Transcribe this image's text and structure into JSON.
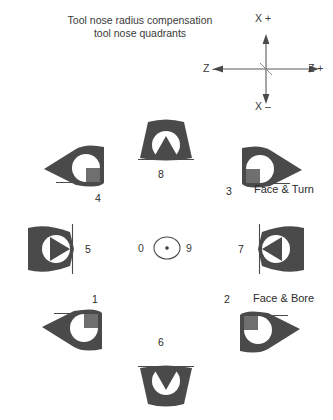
{
  "title": {
    "line1": "Tool nose radius compensation",
    "line2": "tool nose quadrants"
  },
  "axes": {
    "x_positive": "X +",
    "x_negative": "X –",
    "z_positive": "Z +",
    "z_negative": "Z –"
  },
  "center": {
    "left_number": "0",
    "right_number": "9"
  },
  "quadrants": [
    {
      "number": "8",
      "note": ""
    },
    {
      "number": "4",
      "note": ""
    },
    {
      "number": "3",
      "note": "Face & Turn"
    },
    {
      "number": "5",
      "note": ""
    },
    {
      "number": "7",
      "note": ""
    },
    {
      "number": "1",
      "note": ""
    },
    {
      "number": "2",
      "note": "Face & Bore"
    },
    {
      "number": "6",
      "note": ""
    }
  ],
  "colors": {
    "tool_body": "#4a4a4a",
    "tool_hole": "#ffffff",
    "tool_square": "#6f6f6f",
    "background": "#ffffff",
    "text": "#2b2b2b"
  },
  "icons": {
    "axis_cross": "axis-cross-icon",
    "tool_insert": "tool-insert-icon",
    "center_point": "center-point-icon"
  }
}
